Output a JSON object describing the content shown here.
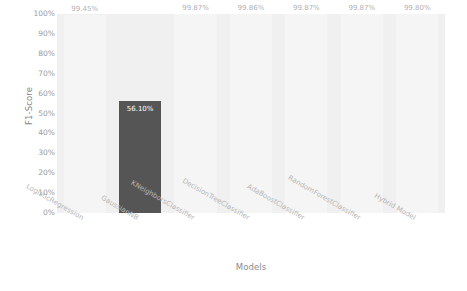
{
  "chart_data": {
    "type": "bar",
    "title": "",
    "xlabel": "Models",
    "ylabel": "F1-Score",
    "categories": [
      "LogisticRegression",
      "GaussianNB",
      "KNeighborsClassifier",
      "DecisionTreeClassifier",
      "AdaBoostClassifier",
      "RandomForestClassifier",
      "Hybrid Model"
    ],
    "values": [
      99.45,
      56.1,
      99.87,
      99.86,
      99.87,
      99.87,
      99.8
    ],
    "value_labels": [
      "99.45%",
      "56.10%",
      "99.87%",
      "99.86%",
      "99.87%",
      "99.87%",
      "99.80%"
    ],
    "ylim": [
      0,
      100
    ],
    "ytick_labels": [
      "0%",
      "10%",
      "20%",
      "30%",
      "40%",
      "50%",
      "60%",
      "70%",
      "80%",
      "90%",
      "100%"
    ],
    "ytick_values": [
      0,
      10,
      20,
      30,
      40,
      50,
      60,
      70,
      80,
      90,
      100
    ],
    "grid": false,
    "legend": "none",
    "highlight_index": 1,
    "colors": {
      "figure_background": "#ffffff",
      "plot_background": "#f0f0f0",
      "bar_default": "#f5f5f5",
      "bar_highlight": "#555555",
      "value_label": "#b2b2b2",
      "value_label_highlight": "#ffffff",
      "tick_label": "#9a9a9a",
      "axis_title": "#8a8a8a"
    }
  }
}
